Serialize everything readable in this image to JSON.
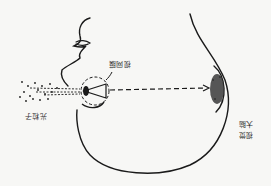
{
  "diagram": {
    "orientation": "rotated-180",
    "labels": {
      "light_particles": "光粒子",
      "retina": "视网膜",
      "visual_brain_line1": "视觉",
      "visual_brain_line2": "大脑"
    },
    "colors": {
      "ink": "#1a1a1a",
      "background": "#f7f7f5"
    }
  }
}
